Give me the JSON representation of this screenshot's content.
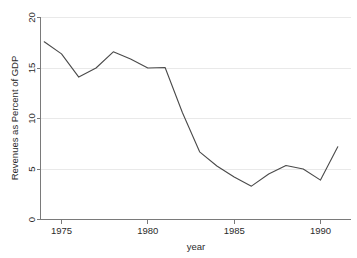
{
  "chart_data": {
    "type": "line",
    "title": "",
    "xlabel": "year",
    "ylabel": "Revenues as Percent of GDP",
    "x": [
      1974,
      1975,
      1976,
      1977,
      1978,
      1979,
      1980,
      1981,
      1982,
      1983,
      1984,
      1985,
      1986,
      1987,
      1988,
      1989,
      1990,
      1991
    ],
    "values": [
      17.6,
      16.4,
      14.1,
      15.0,
      16.6,
      15.9,
      15.0,
      15.05,
      10.6,
      6.7,
      5.3,
      4.2,
      3.3,
      4.5,
      5.35,
      5.0,
      3.9,
      7.2
    ],
    "series": [
      {
        "name": "Revenues as Percent of GDP",
        "values": [
          17.6,
          16.4,
          14.1,
          15.0,
          16.6,
          15.9,
          15.0,
          15.05,
          10.6,
          6.7,
          5.3,
          4.2,
          3.3,
          4.5,
          5.35,
          5.0,
          3.9,
          7.2
        ]
      }
    ],
    "xlim": [
      1974,
      1991
    ],
    "ylim": [
      0,
      20
    ],
    "xticks": [
      1975,
      1980,
      1985,
      1990
    ],
    "xticklabels": [
      "1975",
      "1980",
      "1985",
      "1990"
    ],
    "yticks": [
      0,
      5,
      10,
      15,
      20
    ],
    "yticklabels": [
      "0",
      "5",
      "10",
      "15",
      "20"
    ],
    "grid": "horizontal",
    "legend": "none",
    "line_color": "#4a4a4a",
    "grid_color": "#e9e9e9",
    "axis_color": "#7a7a7a"
  },
  "axis": {
    "y_label": "Revenues as Percent of GDP",
    "x_label": "year",
    "y_tick_0": "0",
    "y_tick_1": "5",
    "y_tick_2": "10",
    "y_tick_3": "15",
    "y_tick_4": "20",
    "x_tick_0": "1975",
    "x_tick_1": "1980",
    "x_tick_2": "1985",
    "x_tick_3": "1990"
  }
}
